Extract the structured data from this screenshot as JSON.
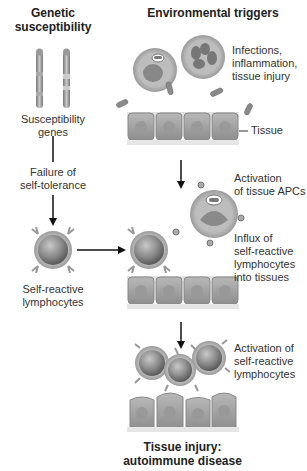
{
  "headers": {
    "genetic": "Genetic susceptibility",
    "genetic_line1": "Genetic",
    "genetic_line2": "susceptibility",
    "environmental": "Environmental triggers"
  },
  "left_column": {
    "susceptibility_genes_line1": "Susceptibility",
    "susceptibility_genes_line2": "genes",
    "failure_line1": "Failure of",
    "failure_line2": "self-tolerance",
    "self_reactive_line1": "Self-reactive",
    "self_reactive_line2": "lymphocytes"
  },
  "right_column": {
    "infections_line1": "Infections,",
    "infections_line2": "inflammation,",
    "infections_line3": "tissue injury",
    "tissue": "Tissue",
    "apc_line1": "Activation",
    "apc_line2": "of tissue APCs",
    "influx_line1": "Influx of",
    "influx_line2": "self-reactive",
    "influx_line3": "lymphocytes",
    "influx_line4": "into tissues",
    "activation_line1": "Activation of",
    "activation_line2": "self-reactive",
    "activation_line3": "lymphocytes"
  },
  "footer": {
    "line1": "Tissue injury:",
    "line2": "autoimmune disease"
  },
  "colors": {
    "cell_fill": "#9a9a9a",
    "tissue_fill": "#a8a8a8",
    "arrow": "#111111",
    "text": "#333333"
  }
}
